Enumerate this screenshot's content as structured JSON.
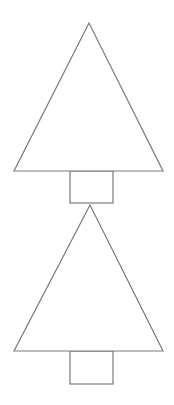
{
  "canvas": {
    "width": 174,
    "height": 405,
    "background": "#ffffff"
  },
  "style": {
    "stroke": "#7a7a7a",
    "fill": "#ffffff",
    "stroke_width": 1.2
  },
  "trees": [
    {
      "name": "tree-1",
      "triangle": {
        "points": [
          [
            89,
            23
          ],
          [
            14,
            171
          ],
          [
            163,
            171
          ]
        ]
      },
      "trunk": {
        "x": 70,
        "y": 171,
        "width": 43,
        "height": 32
      }
    },
    {
      "name": "tree-2",
      "triangle": {
        "points": [
          [
            90,
            205
          ],
          [
            14,
            351
          ],
          [
            163,
            351
          ]
        ]
      },
      "trunk": {
        "x": 70,
        "y": 351,
        "width": 43,
        "height": 33
      }
    }
  ]
}
